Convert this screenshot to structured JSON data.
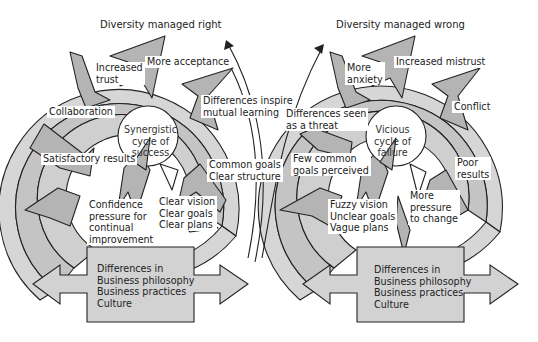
{
  "diagram": {
    "colors": {
      "outer_ring": "#d6d6d6",
      "arrow_fill": "#b4b4b4",
      "inner_fill": "#c9c9c9",
      "outline": "#222222",
      "label_bg": "#ffffff"
    },
    "left_cycle": {
      "title": "Diversity managed right",
      "center": "Synergistic\ncycle of\nsuccess",
      "labels": [
        "Increased\ntrust",
        "More acceptance",
        "Differences inspire\nmutual learning",
        "Collaboration",
        "Satisfactory results",
        "Common goals\nClear structure",
        "Confidence\npressure for\ncontinual\nimprovement",
        "Clear vision\nClear goals\nClear plans"
      ]
    },
    "right_cycle": {
      "title": "Diversity managed wrong",
      "center": "Vicious\ncycle of\nfailure",
      "labels": [
        "More\nanxiety",
        "Increased mistrust",
        "Conflict",
        "Differences seen\nas a threat",
        "Few common\ngoals perceived",
        "Poor\nresults",
        "More\npressure\nto change",
        "Fuzzy vision\nUnclear goals\nVague plans"
      ]
    },
    "left_box": {
      "text": "Differences in\nBusiness philosophy\nBusiness practices\nCulture"
    },
    "right_box": {
      "text": "Differences in\nBusiness philosophy\nBusiness practices\nCulture"
    }
  }
}
